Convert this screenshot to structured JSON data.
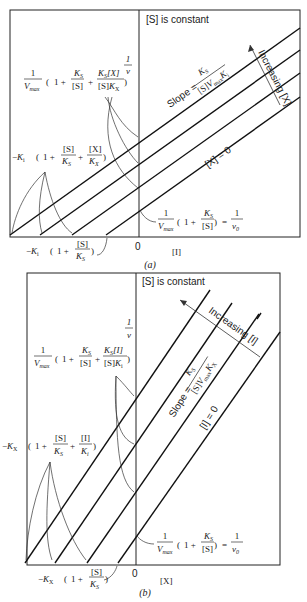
{
  "panel_a": {
    "caption": "(a)",
    "constant_label": "[S] is constant",
    "y_axis_label": "1/v",
    "x_axis_label": "[I]",
    "origin_label": "0",
    "slope_label": "Slope = K_S / ([S] V_max K_i)",
    "slope_prefix": "Slope =",
    "slope_num": "K_S",
    "slope_den": "[S]V_max K_i",
    "increasing_label": "Increasing [X]",
    "zero_line_label": "[X] = 0",
    "y_intercept_label": "1/V_max (1 + K_S/[S] + K_S[X]/([S]K_X))",
    "x_intercept_upper_label": "-K_i (1 + [S]/K_S + [X]/K_X)",
    "x_intercept_lower_label": "-K_i (1 + [S]/K_S)",
    "base_intercept_label": "1/V_max (1 + K_S/[S]) = 1/v0"
  },
  "panel_b": {
    "caption": "(b)",
    "constant_label": "[S] is constant",
    "y_axis_label": "1/v",
    "x_axis_label": "[X]",
    "origin_label": "0",
    "slope_label": "Slope = K_S / ([S] V_max K_X)",
    "slope_prefix": "Slope =",
    "slope_num": "K_S",
    "slope_den": "[S]V_max K_X",
    "increasing_label": "Increasing [I]",
    "zero_line_label": "[I] = 0",
    "y_intercept_label": "1/V_max (1 + K_S/[S] + K_S[I]/([S]K_i))",
    "x_intercept_upper_label": "-K_X (1 + [S]/K_S + [I]/K_i)",
    "x_intercept_lower_label": "-K_X (1 + [S]/K_S)",
    "base_intercept_label": "1/V_max (1 + K_S/[S]) = 1/v0"
  }
}
